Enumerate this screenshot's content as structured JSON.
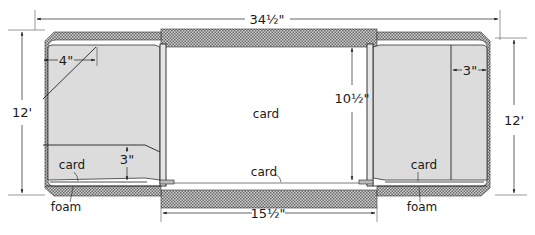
{
  "diagram": {
    "type": "cross-section",
    "dimensions": {
      "overall_width": "34½\"",
      "center_bottom_width": "15½\"",
      "left_height": "12'",
      "right_height": "12'",
      "center_height": "10½\"",
      "left_diagonal_width": "4\"",
      "left_lower_height": "3\"",
      "right_panel_width": "3\""
    },
    "labels": {
      "center": "card",
      "bottom_center": "card",
      "left_card": "card",
      "left_foam": "foam",
      "right_card": "card",
      "right_foam": "foam"
    },
    "colors": {
      "hatch_dark": "#6e6e6e",
      "hatch_light": "#d8d8d8",
      "panel_fill": "#dcdcdc",
      "line": "#222222",
      "background": "#ffffff"
    }
  }
}
